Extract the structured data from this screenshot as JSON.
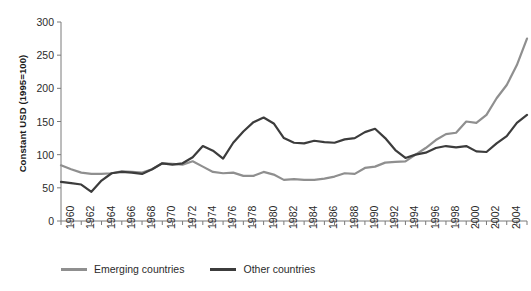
{
  "chart_data": {
    "type": "line",
    "title": "",
    "xlabel": "",
    "ylabel": "Constant USD (1995=100)",
    "ylim": [
      0,
      300
    ],
    "xlim": [
      1960,
      2006
    ],
    "yticks": [
      0,
      50,
      100,
      150,
      200,
      250,
      300
    ],
    "xticks": [
      1960,
      1962,
      1964,
      1966,
      1968,
      1970,
      1972,
      1974,
      1976,
      1978,
      1980,
      1982,
      1984,
      1986,
      1988,
      1990,
      1992,
      1994,
      1996,
      1998,
      2000,
      2002,
      2004,
      2006
    ],
    "grid": false,
    "legend_position": "bottom",
    "x": [
      1960,
      1961,
      1962,
      1963,
      1964,
      1965,
      1966,
      1967,
      1968,
      1969,
      1970,
      1971,
      1972,
      1973,
      1974,
      1975,
      1976,
      1977,
      1978,
      1979,
      1980,
      1981,
      1982,
      1983,
      1984,
      1985,
      1986,
      1987,
      1988,
      1989,
      1990,
      1991,
      1992,
      1993,
      1994,
      1995,
      1996,
      1997,
      1998,
      1999,
      2000,
      2001,
      2002,
      2003,
      2004,
      2005,
      2006
    ],
    "series": [
      {
        "name": "Emerging countries",
        "color": "#8f8f8f",
        "values": [
          84,
          78,
          73,
          71,
          71,
          72,
          75,
          74,
          73,
          78,
          87,
          86,
          85,
          90,
          82,
          74,
          72,
          73,
          68,
          68,
          74,
          70,
          62,
          63,
          62,
          62,
          64,
          67,
          72,
          71,
          80,
          82,
          88,
          89,
          90,
          100,
          110,
          122,
          131,
          133,
          150,
          148,
          160,
          185,
          205,
          235,
          275
        ]
      },
      {
        "name": "Other countries",
        "color": "#3c3c3c",
        "values": [
          59,
          57,
          55,
          44,
          61,
          72,
          74,
          73,
          71,
          78,
          87,
          85,
          87,
          96,
          113,
          106,
          94,
          118,
          135,
          149,
          156,
          147,
          125,
          118,
          117,
          121,
          119,
          118,
          123,
          125,
          134,
          139,
          125,
          107,
          95,
          100,
          103,
          110,
          113,
          111,
          113,
          105,
          104,
          117,
          128,
          148,
          160
        ]
      }
    ]
  },
  "legend": {
    "items": [
      {
        "label": "Emerging countries",
        "color": "#8f8f8f"
      },
      {
        "label": "Other countries",
        "color": "#3c3c3c"
      }
    ]
  }
}
